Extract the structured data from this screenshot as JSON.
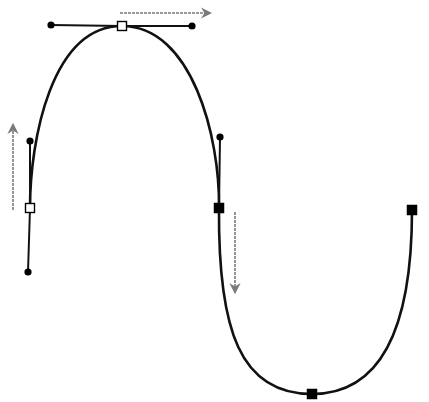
{
  "diagram": {
    "title": "",
    "type": "bezier-path-handles",
    "colors": {
      "background": "#ffffff",
      "curve": "#111111",
      "handle_line": "#111111",
      "direction_arrow": "#7a7a7a",
      "anchor_fill_open": "#ffffff",
      "anchor_fill_solid": "#000000"
    },
    "path": {
      "segments": [
        {
          "from": [
            30,
            208
          ],
          "c1": [
            30,
            141
          ],
          "c2": [
            51,
            26
          ],
          "to": [
            122,
            26
          ]
        },
        {
          "from": [
            122,
            26
          ],
          "c1": [
            192,
            26
          ],
          "c2": [
            220,
            137
          ],
          "to": [
            219,
            208
          ]
        },
        {
          "from": [
            219,
            208
          ],
          "c1": [
            218,
            330
          ],
          "c2": [
            240,
            394
          ],
          "to": [
            312,
            394
          ]
        },
        {
          "from": [
            312,
            394
          ],
          "c1": [
            385,
            394
          ],
          "c2": [
            412,
            320
          ],
          "to": [
            412,
            210
          ]
        }
      ]
    },
    "anchors": [
      {
        "name": "anchor-left-smooth",
        "x": 30,
        "y": 208,
        "shape": "open-square"
      },
      {
        "name": "anchor-top-smooth",
        "x": 122,
        "y": 26,
        "shape": "open-square"
      },
      {
        "name": "anchor-middle-corner",
        "x": 219,
        "y": 208,
        "shape": "solid-square"
      },
      {
        "name": "anchor-bottom",
        "x": 312,
        "y": 394,
        "shape": "solid-square"
      },
      {
        "name": "anchor-end",
        "x": 412,
        "y": 210,
        "shape": "solid-square"
      }
    ],
    "handles": [
      {
        "name": "handle-left-top",
        "from": [
          30,
          208
        ],
        "to": [
          30,
          141
        ]
      },
      {
        "name": "handle-left-bottom",
        "from": [
          30,
          208
        ],
        "to": [
          28,
          272
        ]
      },
      {
        "name": "handle-top-left",
        "from": [
          122,
          26
        ],
        "to": [
          51,
          25
        ]
      },
      {
        "name": "handle-top-right",
        "from": [
          122,
          26
        ],
        "to": [
          192,
          26
        ]
      },
      {
        "name": "handle-middle-up",
        "from": [
          219,
          208
        ],
        "to": [
          220,
          137
        ]
      }
    ],
    "arrows": [
      {
        "name": "direction-arrow-up",
        "from": [
          13,
          210
        ],
        "to": [
          13,
          125
        ]
      },
      {
        "name": "direction-arrow-right",
        "from": [
          120,
          13
        ],
        "to": [
          210,
          13
        ]
      },
      {
        "name": "direction-arrow-down",
        "from": [
          235,
          212
        ],
        "to": [
          235,
          292
        ]
      }
    ]
  }
}
